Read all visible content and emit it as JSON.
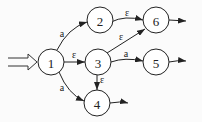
{
  "diagram": {
    "type": "nfa",
    "start_state": "1",
    "states": [
      {
        "id": "1",
        "label": "1",
        "x": 51,
        "y": 62
      },
      {
        "id": "2",
        "label": "2",
        "x": 100,
        "y": 20
      },
      {
        "id": "3",
        "label": "3",
        "x": 98,
        "y": 62
      },
      {
        "id": "4",
        "label": "4",
        "x": 97,
        "y": 103
      },
      {
        "id": "5",
        "label": "5",
        "x": 156,
        "y": 62
      },
      {
        "id": "6",
        "label": "6",
        "x": 156,
        "y": 20
      }
    ],
    "transitions": [
      {
        "from": "1",
        "to": "2",
        "label": "a"
      },
      {
        "from": "1",
        "to": "3",
        "label": "ε"
      },
      {
        "from": "1",
        "to": "4",
        "label": "a"
      },
      {
        "from": "2",
        "to": "6",
        "label": "ε"
      },
      {
        "from": "3",
        "to": "6",
        "label": "ε"
      },
      {
        "from": "3",
        "to": "5",
        "label": "a"
      },
      {
        "from": "3",
        "to": "4",
        "label": "ε"
      }
    ],
    "exit_arrows": [
      "6",
      "5",
      "4"
    ]
  }
}
